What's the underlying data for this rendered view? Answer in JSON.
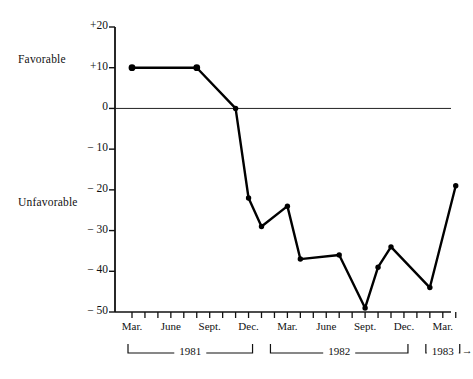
{
  "chart_data": {
    "type": "line",
    "title": "",
    "subtitle": "",
    "xlabel": "",
    "ylabel": "",
    "ylim": [
      -50,
      20
    ],
    "grid": false,
    "legend_position": "none",
    "axis_labels": {
      "positive_side": "Favorable",
      "negative_side": "Unfavorable"
    },
    "y_ticks": [
      {
        "value": 20,
        "label": "+20"
      },
      {
        "value": 10,
        "label": "+10"
      },
      {
        "value": 0,
        "label": "0"
      },
      {
        "value": -10,
        "label": "− 10"
      },
      {
        "value": -20,
        "label": "− 20"
      },
      {
        "value": -30,
        "label": "− 30"
      },
      {
        "value": -40,
        "label": "− 40"
      },
      {
        "value": -50,
        "label": "− 50"
      }
    ],
    "x_tick_months": 26,
    "x_month_labels": [
      {
        "index": 0,
        "label": "Mar."
      },
      {
        "index": 3,
        "label": "June"
      },
      {
        "index": 6,
        "label": "Sept."
      },
      {
        "index": 9,
        "label": "Dec."
      },
      {
        "index": 12,
        "label": "Mar."
      },
      {
        "index": 15,
        "label": "June"
      },
      {
        "index": 18,
        "label": "Sept."
      },
      {
        "index": 21,
        "label": "Dec."
      },
      {
        "index": 24,
        "label": "Mar."
      }
    ],
    "year_brackets": [
      {
        "label": "1981",
        "start_index": 0,
        "end_index": 9
      },
      {
        "label": "1982",
        "start_index": 11,
        "end_index": 21
      },
      {
        "label": "1983",
        "start_index": 23,
        "end_index": 25,
        "arrow": true
      }
    ],
    "series": [
      {
        "name": "Net rating",
        "x": [
          0,
          5,
          8,
          9,
          10,
          12,
          13,
          16,
          18,
          19,
          20,
          23,
          25
        ],
        "values": [
          10,
          10,
          0,
          -22,
          -29,
          -24,
          -37,
          -36,
          -49,
          -39,
          -34,
          -44,
          -19
        ],
        "point_labels": [
          "Mar. 1981",
          "Aug. 1981",
          "Nov. 1981",
          "Dec. 1981",
          "Jan. 1982",
          "Mar. 1982",
          "Apr. 1982",
          "July 1982",
          "Sept. 1982",
          "Oct. 1982",
          "Nov. 1982",
          "Feb. 1983",
          "Apr. 1983"
        ],
        "color": "#000000",
        "marker": "circle"
      }
    ],
    "zero_line": true,
    "arrow_end_label": "→"
  }
}
